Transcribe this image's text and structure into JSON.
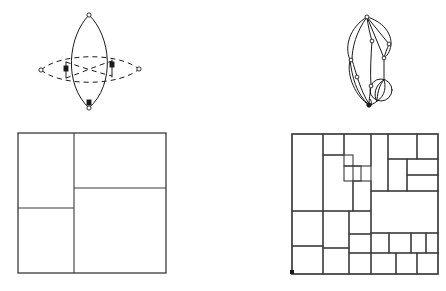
{
  "figure": {
    "background_color": "#ffffff",
    "stroke_color": "#1a1a1a",
    "rect_stroke_color": "#3a3a3a",
    "panels": [
      {
        "id": "top-left",
        "name": "vesica-with-dashed-ellipse",
        "label": "",
        "description": "Vertical lens (vesica piscis) crossed by a horizontal dashed lens/ellipse",
        "bounds": [
          40,
          12,
          115,
          100
        ]
      },
      {
        "id": "top-right",
        "name": "planar-multigraph",
        "label": "",
        "description": "Curved planar multigraph with vertices and a bundle of parallel arcs forming a circle",
        "bounds": [
          345,
          10,
          55,
          105
        ]
      },
      {
        "id": "bottom-left",
        "name": "pinwheel-rectangle-partition",
        "label": "",
        "description": "Square subdivided into four rectangles in a pinwheel arrangement",
        "bounds": [
          18,
          133,
          148,
          140
        ]
      },
      {
        "id": "bottom-right",
        "name": "squared-rectangle-packing",
        "label": "",
        "description": "Square subdivided into many rectangles of differing sizes",
        "bounds": [
          292,
          134,
          146,
          140
        ]
      }
    ],
    "top_left_panel": {
      "solid_lens": {
        "apex_top": [
          89,
          15
        ],
        "apex_bottom": [
          89,
          108
        ],
        "left_bulge_x": 64,
        "right_bulge_x": 114
      },
      "dashed_lens": {
        "apex_left": [
          41,
          70
        ],
        "apex_right": [
          139,
          69
        ],
        "top_bulge_y": 56,
        "bottom_bulge_y": 82
      },
      "nodes": [
        {
          "name": "node-top",
          "x": 89,
          "y": 15,
          "filled": false
        },
        {
          "name": "node-bottom",
          "x": 89,
          "y": 108,
          "filled": false
        },
        {
          "name": "node-left-tip",
          "x": 41,
          "y": 70,
          "filled": false
        },
        {
          "name": "node-right-tip",
          "x": 139,
          "y": 69,
          "filled": false
        },
        {
          "name": "node-left-cross",
          "x": 66,
          "y": 70,
          "filled": true
        },
        {
          "name": "node-right-cross",
          "x": 112,
          "y": 68,
          "filled": true
        }
      ]
    },
    "top_right_panel": {
      "nodes": [
        {
          "name": "node-apex-top",
          "x": 367,
          "y": 17
        },
        {
          "name": "node-upper-right",
          "x": 389,
          "y": 44
        },
        {
          "name": "node-mid-upper-left",
          "x": 372,
          "y": 41
        },
        {
          "name": "node-mid-right",
          "x": 384,
          "y": 58
        },
        {
          "name": "node-mid-left",
          "x": 352,
          "y": 60
        },
        {
          "name": "node-lower-left",
          "x": 358,
          "y": 78
        },
        {
          "name": "node-lower-mid",
          "x": 372,
          "y": 87
        },
        {
          "name": "node-circle-top",
          "x": 384,
          "y": 80
        },
        {
          "name": "node-apex-bottom",
          "x": 369,
          "y": 104
        }
      ],
      "circle_bundle": {
        "center": [
          381,
          90
        ],
        "radius": 11,
        "arc_count": 4
      }
    },
    "bottom_left_panel": {
      "frame": {
        "x": 18,
        "y": 133,
        "w": 148,
        "h": 140
      },
      "cells": [
        {
          "name": "cell-top-left",
          "x": 18,
          "y": 133,
          "w": 56,
          "h": 75
        },
        {
          "name": "cell-top-right",
          "x": 74,
          "y": 133,
          "w": 92,
          "h": 55
        },
        {
          "name": "cell-bottom-right",
          "x": 74,
          "y": 188,
          "w": 92,
          "h": 85
        },
        {
          "name": "cell-bottom-left",
          "x": 18,
          "y": 208,
          "w": 56,
          "h": 65
        }
      ]
    },
    "bottom_right_panel": {
      "frame": {
        "x": 292,
        "y": 134,
        "w": 146,
        "h": 140
      },
      "cells": [
        {
          "name": "cell-01",
          "x": 292,
          "y": 134,
          "w": 31,
          "h": 77
        },
        {
          "name": "cell-02",
          "x": 323,
          "y": 134,
          "w": 21,
          "h": 21
        },
        {
          "name": "cell-03",
          "x": 323,
          "y": 155,
          "w": 30,
          "h": 56
        },
        {
          "name": "cell-04",
          "x": 344,
          "y": 134,
          "w": 27,
          "h": 32
        },
        {
          "name": "cell-05",
          "x": 344,
          "y": 166,
          "w": 17,
          "h": 15
        },
        {
          "name": "cell-06",
          "x": 353,
          "y": 181,
          "w": 18,
          "h": 30
        },
        {
          "name": "cell-07",
          "x": 371,
          "y": 134,
          "w": 17,
          "h": 57
        },
        {
          "name": "cell-08",
          "x": 388,
          "y": 134,
          "w": 29,
          "h": 25
        },
        {
          "name": "cell-09",
          "x": 417,
          "y": 134,
          "w": 21,
          "h": 25
        },
        {
          "name": "cell-10",
          "x": 388,
          "y": 159,
          "w": 19,
          "h": 32
        },
        {
          "name": "cell-11",
          "x": 407,
          "y": 159,
          "w": 31,
          "h": 16
        },
        {
          "name": "cell-12",
          "x": 407,
          "y": 175,
          "w": 31,
          "h": 16
        },
        {
          "name": "cell-13",
          "x": 371,
          "y": 191,
          "w": 67,
          "h": 42
        },
        {
          "name": "cell-14",
          "x": 292,
          "y": 211,
          "w": 31,
          "h": 35
        },
        {
          "name": "cell-15",
          "x": 292,
          "y": 246,
          "w": 31,
          "h": 28
        },
        {
          "name": "cell-16",
          "x": 323,
          "y": 211,
          "w": 26,
          "h": 37
        },
        {
          "name": "cell-17",
          "x": 323,
          "y": 248,
          "w": 26,
          "h": 26
        },
        {
          "name": "cell-18",
          "x": 349,
          "y": 211,
          "w": 22,
          "h": 23
        },
        {
          "name": "cell-19",
          "x": 349,
          "y": 234,
          "w": 22,
          "h": 19
        },
        {
          "name": "cell-20",
          "x": 349,
          "y": 253,
          "w": 22,
          "h": 21
        },
        {
          "name": "cell-21",
          "x": 371,
          "y": 233,
          "w": 18,
          "h": 20
        },
        {
          "name": "cell-22",
          "x": 389,
          "y": 233,
          "w": 22,
          "h": 20
        },
        {
          "name": "cell-23",
          "x": 411,
          "y": 233,
          "w": 15,
          "h": 20
        },
        {
          "name": "cell-24",
          "x": 426,
          "y": 233,
          "w": 12,
          "h": 20
        },
        {
          "name": "cell-25",
          "x": 371,
          "y": 253,
          "w": 25,
          "h": 21
        },
        {
          "name": "cell-26",
          "x": 396,
          "y": 253,
          "w": 21,
          "h": 21
        },
        {
          "name": "cell-27",
          "x": 417,
          "y": 253,
          "w": 21,
          "h": 21
        }
      ],
      "corner_marker": {
        "name": "origin-marker",
        "x": 292,
        "y": 270
      }
    }
  }
}
